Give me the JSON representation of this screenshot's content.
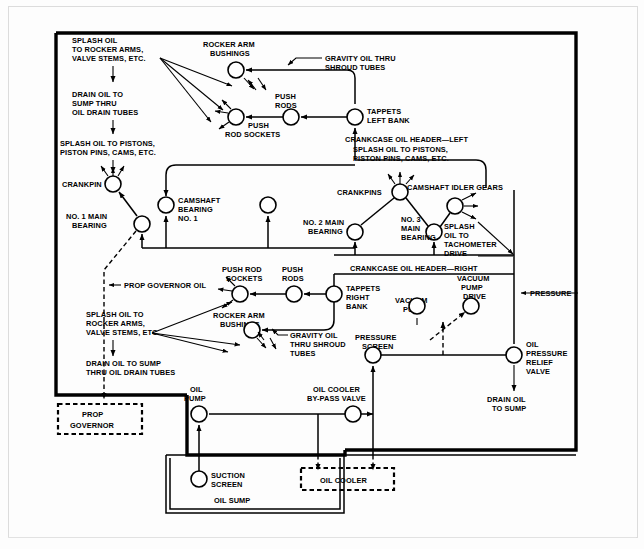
{
  "diagram": {
    "labels": {
      "splash_oil_rocker_left": "SPLASH OIL\nTO ROCKER ARMS,\nVALVE STEMS, ETC.",
      "drain_oil_sump_tubes_left": "DRAIN OIL TO\nSUMP THRU\nOIL DRAIN TUBES",
      "splash_oil_pistons_left": "SPLASH OIL TO PISTONS,\nPISTON PINS, CAMS, ETC.",
      "rocker_arm_bushings_top": "ROCKER ARM\nBUSHINGS",
      "gravity_oil_shroud_top": "GRAVITY OIL THRU\nSHROUD TUBES",
      "push_rods_top": "PUSH\nRODS",
      "push_rod_sockets_top": "PUSH\nROD SOCKETS",
      "tappets_left_bank": "TAPPETS\nLEFT BANK",
      "crankcase_header_left": "CRANKCASE OIL HEADER—LEFT",
      "splash_oil_pistons_mid": "SPLASH OIL TO PISTONS,\nPISTON PINS, CAMS, ETC.",
      "crankpin": "CRANKPIN",
      "no1_main_bearing": "NO. 1 MAIN\nBEARING",
      "camshaft_bearing_no1": "CAMSHAFT\nBEARING\nNO. 1",
      "crankpins": "CRANKPINS",
      "camshaft_idler_gears": "CAMSHAFT IDLER GEARS",
      "no2_main_bearing": "NO. 2 MAIN\nBEARING",
      "no3_main_bearing": "NO. 3\nMAIN\nBEARING",
      "splash_oil_tachometer": "SPLASH\nOIL TO\nTACHOMETER\nDRIVE",
      "prop_governor_oil": "PROP GOVERNOR OIL",
      "push_rod_sockets_mid": "PUSH ROD\nSOCKETS",
      "push_rods_mid": "PUSH\nRODS",
      "crankcase_header_right": "CRANKCASE OIL HEADER—RIGHT",
      "tappets_right_bank": "TAPPETS\nRIGHT\nBANK",
      "vacuum_pump_drive": "VACUUM\nPUMP\nDRIVE",
      "pressure": "PRESSURE",
      "splash_oil_rocker_low": "SPLASH OIL TO\nROCKER ARMS,\nVALVE STEMS, ETC.",
      "rocker_arm_bushings_low": "ROCKER ARM\nBUSHINGS",
      "vacuum_pump": "VACUUM\nPUMP",
      "pressure_screen": "PRESSURE\nSCREEN",
      "oil_pressure_relief_valve": "OIL\nPRESSURE\nRELIEF\nVALVE",
      "drain_oil_sump_tubes_low": "DRAIN OIL TO SUMP\nTHRU OIL DRAIN TUBES",
      "gravity_oil_shroud_low": "GRAVITY OIL\nTHRU SHROUD\nTUBES",
      "drain_oil_to_sump": "DRAIN OIL\nTO SUMP",
      "prop_governor": "PROP\nGOVERNOR",
      "oil_pump": "OIL\nPUMP",
      "oil_cooler_bypass_valve": "OIL COOLER\nBY-PASS VALVE",
      "suction_screen": "SUCTION\nSCREEN",
      "oil_sump": "OIL SUMP",
      "oil_cooler": "OIL COOLER"
    },
    "caption": ""
  }
}
